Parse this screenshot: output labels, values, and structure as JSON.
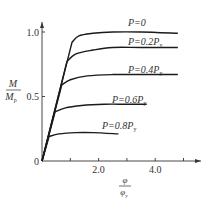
{
  "chart_data": {
    "type": "line",
    "title": "",
    "xlabel": {
      "numerator": "φ",
      "denominator": "φ",
      "denominator_sub": "y"
    },
    "ylabel": {
      "numerator": "M",
      "denominator": "M",
      "denominator_sub": "p"
    },
    "xlim": [
      0,
      5.5
    ],
    "ylim": [
      0,
      1.15
    ],
    "x_ticks": [
      1.0,
      2.0,
      3.0,
      4.0,
      5.0
    ],
    "x_tick_labels": [
      {
        "value": 2.0,
        "label": "2.0"
      },
      {
        "value": 4.0,
        "label": "4.0"
      }
    ],
    "y_ticks": [
      0,
      0.5,
      1.0
    ],
    "y_tick_labels": [
      {
        "value": 0,
        "label": "0"
      },
      {
        "value": 0.5,
        "label": "0.5"
      },
      {
        "value": 1.0,
        "label": "1.0"
      }
    ],
    "grid": false,
    "legend": "inline labels above each curve",
    "series": [
      {
        "name": "P=0",
        "label_main": "P=0",
        "label_sub": "",
        "label_pos": [
          128,
          26
        ],
        "x": [
          0,
          1.06,
          1.3,
          1.8,
          2.5,
          3.5,
          4.8
        ],
        "y": [
          0,
          0.92,
          0.97,
          0.99,
          1.0,
          1.0,
          0.99
        ]
      },
      {
        "name": "P=0.2Py",
        "label_main": "P=0.2P",
        "label_sub": "y",
        "label_pos": [
          128,
          45
        ],
        "x": [
          0,
          0.88,
          1.2,
          1.8,
          2.5,
          3.5,
          4.8
        ],
        "y": [
          0,
          0.77,
          0.83,
          0.86,
          0.88,
          0.88,
          0.88
        ]
      },
      {
        "name": "P=0.4Py",
        "label_main": "P=0.4P",
        "label_sub": "y",
        "label_pos": [
          128,
          73
        ],
        "x": [
          0,
          0.7,
          1.0,
          1.6,
          2.5,
          3.5,
          4.8
        ],
        "y": [
          0,
          0.59,
          0.63,
          0.66,
          0.67,
          0.67,
          0.67
        ]
      },
      {
        "name": "P=0.6Py",
        "label_main": "P=0.6P",
        "label_sub": "y",
        "label_pos": [
          112,
          103
        ],
        "x": [
          0,
          0.46,
          0.8,
          1.4,
          2.2,
          3.0,
          3.7
        ],
        "y": [
          0,
          0.38,
          0.41,
          0.43,
          0.44,
          0.44,
          0.44
        ]
      },
      {
        "name": "P=0.8Py",
        "label_main": "P=0.8P",
        "label_sub": "y",
        "label_pos": [
          102,
          129
        ],
        "x": [
          0,
          0.25,
          0.6,
          1.2,
          1.8,
          2.7
        ],
        "y": [
          0,
          0.19,
          0.21,
          0.22,
          0.22,
          0.21
        ]
      }
    ]
  },
  "plot_geometry": {
    "origin_x": 42,
    "origin_y": 161,
    "px_per_x": 28.3,
    "px_per_y": 129,
    "x_axis_end": 201,
    "y_axis_top": 22
  },
  "colors": {
    "line": "#1a1a1a",
    "axis": "#333333",
    "background": "#ffffff"
  }
}
